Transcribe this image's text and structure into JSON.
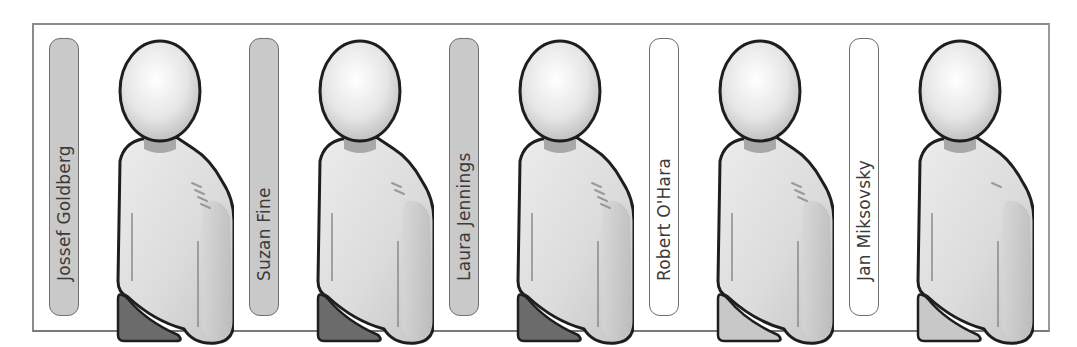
{
  "diagram": {
    "type": "people-roster",
    "frame_border_color": "#8a8a8a",
    "people": [
      {
        "name": "Jossef Goldberg",
        "label_style": "gray",
        "badge_style": "dark",
        "shoulder_marks": 4,
        "x": 32
      },
      {
        "name": "Suzan Fine",
        "label_style": "gray",
        "badge_style": "dark",
        "shoulder_marks": 2,
        "x": 232
      },
      {
        "name": "Laura Jennings",
        "label_style": "gray",
        "badge_style": "dark",
        "shoulder_marks": 4,
        "x": 432
      },
      {
        "name": "Robert O'Hara",
        "label_style": "white",
        "badge_style": "light",
        "shoulder_marks": 3,
        "x": 632
      },
      {
        "name": "Jan Miksovsky",
        "label_style": "white",
        "badge_style": "light",
        "shoulder_marks": 1,
        "x": 832
      }
    ],
    "colors": {
      "label_gray": "#c9c9c9",
      "label_white": "#ffffff",
      "badge_dark": "#6b6b6b",
      "badge_light": "#c8c8c8",
      "outline": "#1e1e1e",
      "body_fill": "#dcdcdc",
      "neck_fill": "#a8a8a8"
    }
  }
}
